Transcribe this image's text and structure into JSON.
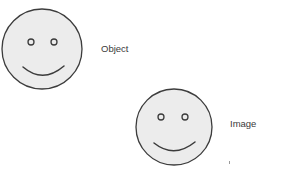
{
  "figures": [
    {
      "id": "object",
      "label": "Object",
      "face": {
        "cx": 42,
        "cy": 49,
        "r": 40
      },
      "eyes": [
        {
          "cx": 31,
          "cy": 42,
          "r": 3
        },
        {
          "cx": 54,
          "cy": 42,
          "r": 3
        }
      ],
      "smile": {
        "x1": 23,
        "y1": 67,
        "qx": 43,
        "qy": 84,
        "x2": 64,
        "y2": 66
      },
      "label_pos": {
        "x": 101,
        "y": 44
      }
    },
    {
      "id": "image",
      "label": "Image",
      "face": {
        "cx": 174,
        "cy": 127,
        "r": 38
      },
      "eyes": [
        {
          "cx": 161,
          "cy": 117,
          "r": 3
        },
        {
          "cx": 185,
          "cy": 117,
          "r": 3
        }
      ],
      "smile": {
        "x1": 154,
        "y1": 143,
        "qx": 174,
        "qy": 159,
        "x2": 195,
        "y2": 142
      },
      "label_pos": {
        "x": 230,
        "y": 119
      }
    }
  ],
  "colors": {
    "face_fill": "#ececec",
    "stroke": "#3c3c3c",
    "text": "#3a3a3a",
    "background": "#ffffff"
  }
}
